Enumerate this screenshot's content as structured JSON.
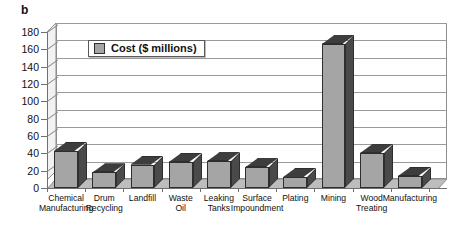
{
  "panel": {
    "label": "b"
  },
  "legend": {
    "position": "inside-top-left",
    "swatch_color": "#a5a5a5",
    "entries": [
      {
        "label": "Cost ($ millions)"
      }
    ]
  },
  "axis": {
    "y_ticks": [
      "0",
      "20",
      "40",
      "60",
      "80",
      "100",
      "120",
      "140",
      "160",
      "180"
    ]
  },
  "colors": {
    "bar_front": "#a5a5a5",
    "bar_side": "#4a4a4a",
    "bar_top": "#3d3d3d",
    "bar_edge": "#2e2e2e",
    "gridline": "#9a9a9a",
    "axis": "#6f6f6f",
    "background": "#ffffff"
  },
  "chart_data": {
    "type": "bar",
    "title": "",
    "subtitle": "",
    "xlabel": "",
    "ylabel": "",
    "ylim": [
      0,
      180
    ],
    "ytick_step": 20,
    "grid": true,
    "legend_position": "inside-top-left",
    "style": "3d-column",
    "categories": [
      "Chemical\nManufacturing",
      "Drum\nRecycling",
      "Landfill",
      "Waste\nOil",
      "Leaking\nTanks",
      "Surface\nImpoundment",
      "Plating",
      "Mining",
      "Wood\nTreating",
      "Manufacturing"
    ],
    "series": [
      {
        "name": "Cost ($ millions)",
        "values": [
          43,
          18,
          27,
          30,
          31,
          24,
          13,
          166,
          40,
          14
        ]
      }
    ]
  }
}
